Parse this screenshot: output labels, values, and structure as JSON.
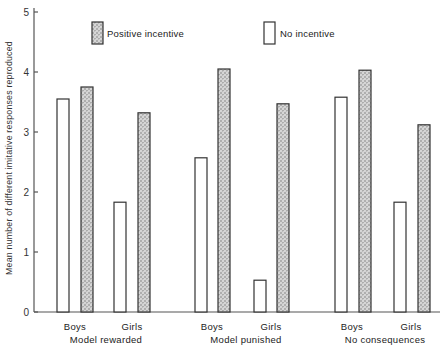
{
  "chart_data": {
    "type": "bar",
    "title": "",
    "xlabel": "",
    "ylabel": "Mean number of different imitative responses reproduced",
    "ylim": [
      0,
      5
    ],
    "yticks": [
      0,
      1,
      2,
      3,
      4,
      5
    ],
    "grid": false,
    "legend_position": "top",
    "groups": [
      "Model rewarded",
      "Model punished",
      "No consequences"
    ],
    "subcategories": [
      "Boys",
      "Girls"
    ],
    "categories": [
      "Model rewarded - Boys",
      "Model rewarded - Girls",
      "Model punished - Boys",
      "Model punished - Girls",
      "No consequences - Boys",
      "No consequences - Girls"
    ],
    "series": [
      {
        "name": "No incentive",
        "style": "open",
        "values": [
          3.55,
          1.83,
          2.57,
          0.53,
          3.58,
          1.83
        ]
      },
      {
        "name": "Positive incentive",
        "style": "stippled",
        "values": [
          3.75,
          3.32,
          4.05,
          3.47,
          4.03,
          3.12
        ]
      }
    ]
  },
  "legend": {
    "positive": "Positive incentive",
    "none": "No incentive"
  },
  "axis": {
    "ylabel": "Mean number of different imitative responses reproduced",
    "ticks": [
      "0",
      "1",
      "2",
      "3",
      "4",
      "5"
    ]
  },
  "labels": {
    "boys": "Boys",
    "girls": "Girls",
    "group1": "Model rewarded",
    "group2": "Model punished",
    "group3": "No consequences"
  },
  "colors": {
    "stroke": "#333333",
    "stipple": "#9a9a9a",
    "background": "#ffffff"
  }
}
